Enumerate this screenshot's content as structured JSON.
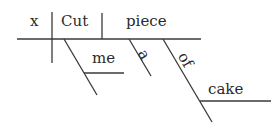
{
  "diagram": {
    "type": "sentence-diagram",
    "words": {
      "subject": "x",
      "verb": "Cut",
      "direct_object": "piece",
      "indirect_object": "me",
      "article": "a",
      "preposition": "of",
      "prepositional_object": "cake"
    },
    "line_color": "#3a3a3a",
    "text_color": "#2a2a2a"
  }
}
